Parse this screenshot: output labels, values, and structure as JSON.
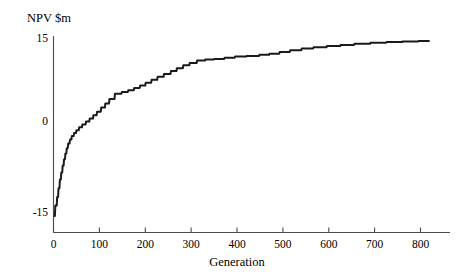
{
  "chart_data": {
    "type": "line",
    "title": "",
    "xlabel": "Generation",
    "ylabel": "NPV $m",
    "xlim": [
      0,
      820
    ],
    "ylim": [
      -16.5,
      16.5
    ],
    "grid": false,
    "legend": "none",
    "xticks": [
      0,
      100,
      200,
      300,
      400,
      500,
      600,
      700,
      800
    ],
    "xtick_labels": [
      "0",
      "100",
      "200",
      "300",
      "400",
      "500",
      "600",
      "700",
      "800"
    ],
    "yticks": [
      -15,
      0,
      15
    ],
    "ytick_labels": [
      "-15",
      "0",
      "15"
    ],
    "series": [
      {
        "name": "NPV",
        "x": [
          0,
          3,
          4,
          7,
          8,
          10,
          11,
          13,
          14,
          16,
          17,
          19,
          20,
          22,
          23,
          25,
          26,
          28,
          29,
          31,
          32,
          35,
          36,
          39,
          40,
          44,
          45,
          49,
          50,
          55,
          56,
          62,
          63,
          70,
          71,
          78,
          79,
          86,
          87,
          94,
          95,
          103,
          104,
          112,
          113,
          121,
          122,
          133,
          134,
          148,
          149,
          162,
          163,
          175,
          176,
          188,
          189,
          200,
          201,
          213,
          214,
          226,
          227,
          240,
          241,
          255,
          256,
          268,
          269,
          282,
          283,
          296,
          297,
          312,
          313,
          330,
          331,
          350,
          351,
          372,
          373,
          395,
          396,
          420,
          421,
          448,
          449,
          470,
          471,
          492,
          493,
          515,
          516,
          540,
          541,
          566,
          567,
          595,
          596,
          625,
          626,
          655,
          656,
          690,
          691,
          725,
          726,
          760,
          761,
          795,
          796,
          820
        ],
        "y": [
          -15.7,
          -15.7,
          -13.9,
          -13.9,
          -12.4,
          -12.4,
          -10.9,
          -10.9,
          -9.4,
          -9.4,
          -8.2,
          -8.2,
          -7.0,
          -7.0,
          -5.9,
          -5.9,
          -4.9,
          -4.9,
          -4.0,
          -4.0,
          -3.2,
          -3.2,
          -2.5,
          -2.5,
          -1.9,
          -1.9,
          -1.4,
          -1.4,
          -0.9,
          -0.9,
          -0.4,
          -0.4,
          0.1,
          0.1,
          0.6,
          0.6,
          1.1,
          1.1,
          1.7,
          1.7,
          2.3,
          2.3,
          3.0,
          3.0,
          3.7,
          3.7,
          4.5,
          4.5,
          5.4,
          5.4,
          5.7,
          5.7,
          6.0,
          6.0,
          6.4,
          6.4,
          6.8,
          6.8,
          7.3,
          7.3,
          7.8,
          7.8,
          8.3,
          8.3,
          8.8,
          8.8,
          9.3,
          9.3,
          9.8,
          9.8,
          10.3,
          10.3,
          10.7,
          10.7,
          11.1,
          11.1,
          11.3,
          11.3,
          11.4,
          11.4,
          11.6,
          11.6,
          11.8,
          11.8,
          11.9,
          11.9,
          12.1,
          12.1,
          12.3,
          12.3,
          12.6,
          12.6,
          12.9,
          12.9,
          13.2,
          13.2,
          13.4,
          13.4,
          13.6,
          13.6,
          13.8,
          13.8,
          14.0,
          14.0,
          14.2,
          14.2,
          14.3,
          14.3,
          14.4,
          14.4,
          14.5,
          14.5
        ]
      }
    ]
  },
  "axes": {
    "ylabel": "NPV $m",
    "xlabel": "Generation"
  }
}
